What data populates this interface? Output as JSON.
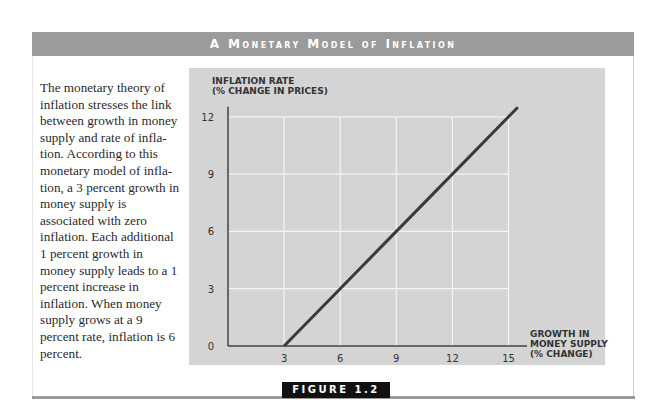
{
  "header": {
    "title": "A Monetary Model of Inflation"
  },
  "caption": {
    "text": "The monetary theory of inflation stresses the link between growth in money supply and rate of infla-tion. According to this monetary model of infla-tion, a 3 percent growth in money supply is associated with zero inflation. Each additional 1 percent growth in money supply leads to a 1 percent increase in inflation. When money supply grows at a 9 percent rate, inflation is 6 percent."
  },
  "figure": {
    "label": "FIGURE 1.2"
  },
  "colors": {
    "header_bg": "#9b9b9b",
    "plot_bg": "#d4d4d4",
    "line": "#3a3a3a",
    "grid": "#f4f4f4",
    "figure_tag_bg": "#111111"
  },
  "chart_data": {
    "type": "line",
    "title": "A Monetary Model of Inflation",
    "xlabel": "Growth in Money Supply (% change)",
    "ylabel": "Inflation Rate (% change in prices)",
    "ylabel_lines": [
      "INFLATION RATE",
      "(% CHANGE IN PRICES)"
    ],
    "xlabel_lines": [
      "GROWTH IN",
      "MONEY SUPPLY",
      "(% CHANGE)"
    ],
    "x_ticks": [
      3,
      6,
      9,
      12,
      15
    ],
    "y_ticks": [
      0,
      3,
      6,
      9,
      12
    ],
    "xlim": [
      0,
      16
    ],
    "ylim": [
      0,
      13
    ],
    "grid": true,
    "series": [
      {
        "name": "Inflation",
        "x": [
          3,
          6,
          9,
          12,
          15,
          15.5
        ],
        "y": [
          0,
          3,
          6,
          9,
          12,
          12.5
        ]
      }
    ]
  }
}
